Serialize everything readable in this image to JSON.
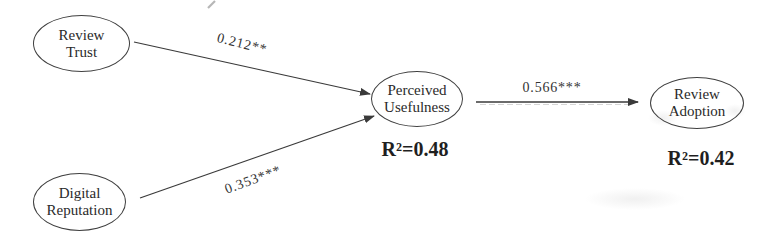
{
  "diagram": {
    "type": "path-model",
    "nodes": {
      "review_trust": {
        "line1": "Review",
        "line2": "Trust"
      },
      "digital_reputation": {
        "line1": "Digital",
        "line2": "Reputation"
      },
      "perceived_usefulness": {
        "line1": "Perceived",
        "line2": "Usefulness",
        "r_squared": "R²=0.48"
      },
      "review_adoption": {
        "line1": "Review",
        "line2": "Adoption",
        "r_squared": "R²=0.42"
      }
    },
    "paths": {
      "trust_to_usefulness": {
        "from": "Review Trust",
        "to": "Perceived Usefulness",
        "coefficient": "0.212**"
      },
      "reputation_to_usefulness": {
        "from": "Digital Reputation",
        "to": "Perceived Usefulness",
        "coefficient": "0.353***"
      },
      "usefulness_to_adoption": {
        "from": "Perceived Usefulness",
        "to": "Review Adoption",
        "coefficient": "0.566***"
      }
    },
    "colors": {
      "background": "#ffffff",
      "ink": "#3a3a3a",
      "text": "#2a2a2a"
    }
  }
}
